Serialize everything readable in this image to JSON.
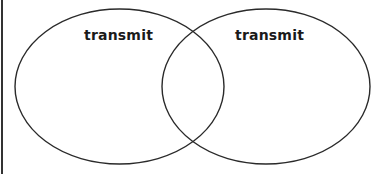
{
  "venn": {
    "left_set": {
      "label": "transmit"
    },
    "right_set": {
      "label": "transmit"
    },
    "stroke_color": "#2a2a2a",
    "background": "#ffffff"
  }
}
